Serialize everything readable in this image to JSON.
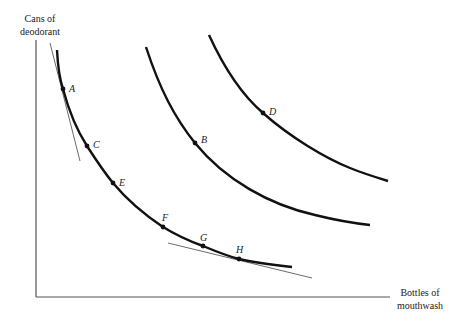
{
  "axes": {
    "y_label_line1": "Cans of",
    "y_label_line2": "deodorant",
    "x_label_line1": "Bottles of",
    "x_label_line2": "mouthwash"
  },
  "curves": [
    {
      "name": "indifference-curve-1",
      "points": [
        "A",
        "C",
        "E",
        "F",
        "G",
        "H"
      ]
    },
    {
      "name": "indifference-curve-2",
      "points": [
        "B"
      ]
    },
    {
      "name": "indifference-curve-3",
      "points": [
        "D"
      ]
    }
  ],
  "points": {
    "A": "A",
    "B": "B",
    "C": "C",
    "D": "D",
    "E": "E",
    "F": "F",
    "G": "G",
    "H": "H"
  },
  "tangent_lines": [
    {
      "name": "tangent-at-A"
    },
    {
      "name": "tangent-at-H"
    }
  ],
  "colors": {
    "curve": "#111111",
    "axis": "#555555",
    "tangent": "#444444"
  }
}
